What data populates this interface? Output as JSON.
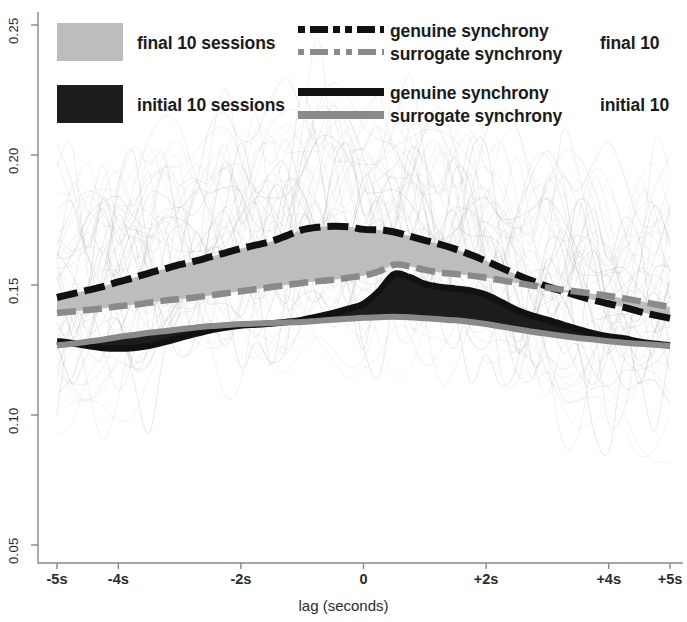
{
  "figure": {
    "background": "#ffffff",
    "axis_color": "#777777"
  },
  "legend": {
    "final_swatch_label": "final 10 sessions",
    "initial_swatch_label": "initial 10 sessions",
    "final_swatch_color": "#bdbdbd",
    "initial_swatch_color": "#1c1c1c",
    "final_genuine_label": "genuine synchrony",
    "final_surrogate_label": "surrogate synchrony",
    "initial_genuine_label": "genuine synchrony",
    "initial_surrogate_label": "surrogate synchrony",
    "final_group_label": "final 10",
    "initial_group_label": "initial 10"
  },
  "chart_data": {
    "type": "area",
    "title": "",
    "xlabel": "lag (seconds)",
    "ylabel": "",
    "xlim": [
      -5,
      5
    ],
    "ylim": [
      0.035,
      0.262
    ],
    "grid": false,
    "legend_position": "top",
    "xticks": [
      -5,
      -4,
      -2,
      0,
      2,
      4,
      5
    ],
    "xticklabels": [
      "-5s",
      "-4s",
      "-2s",
      "0",
      "+2s",
      "+4s",
      "+5s"
    ],
    "yticks": [
      0.05,
      0.1,
      0.15,
      0.2,
      0.25
    ],
    "yticklabels": [
      "0.05",
      "0.10",
      "0.15",
      "0.20",
      "0.25"
    ],
    "x": [
      -5.0,
      -4.75,
      -4.5,
      -4.25,
      -4.0,
      -3.75,
      -3.5,
      -3.25,
      -3.0,
      -2.75,
      -2.5,
      -2.25,
      -2.0,
      -1.75,
      -1.5,
      -1.25,
      -1.0,
      -0.75,
      -0.5,
      -0.25,
      0.0,
      0.25,
      0.5,
      0.75,
      1.0,
      1.25,
      1.5,
      1.75,
      2.0,
      2.25,
      2.5,
      2.75,
      3.0,
      3.25,
      3.5,
      3.75,
      4.0,
      4.25,
      4.5,
      4.75,
      5.0
    ],
    "series": [
      {
        "name": "genuine synchrony - final 10",
        "style": "dashed",
        "color": "#111111",
        "values": [
          0.1452,
          0.1466,
          0.148,
          0.1494,
          0.1512,
          0.1528,
          0.1546,
          0.1562,
          0.1578,
          0.1592,
          0.1608,
          0.1624,
          0.164,
          0.1654,
          0.1668,
          0.169,
          0.1712,
          0.1722,
          0.1726,
          0.1724,
          0.1714,
          0.1712,
          0.1704,
          0.1688,
          0.1672,
          0.1656,
          0.1638,
          0.1616,
          0.1592,
          0.1566,
          0.154,
          0.1516,
          0.1494,
          0.1476,
          0.1458,
          0.1442,
          0.1428,
          0.1414,
          0.1398,
          0.1384,
          0.1372
        ]
      },
      {
        "name": "surrogate synchrony - final 10",
        "style": "dashed",
        "color": "#8a8a8a",
        "values": [
          0.1392,
          0.1398,
          0.1404,
          0.141,
          0.1418,
          0.1424,
          0.1432,
          0.144,
          0.1446,
          0.1452,
          0.146,
          0.1468,
          0.1476,
          0.1484,
          0.1492,
          0.15,
          0.1508,
          0.1514,
          0.152,
          0.1528,
          0.1536,
          0.1552,
          0.1578,
          0.1572,
          0.1558,
          0.1548,
          0.1542,
          0.1536,
          0.1528,
          0.1518,
          0.1508,
          0.1498,
          0.149,
          0.1482,
          0.1474,
          0.1466,
          0.1458,
          0.1448,
          0.1438,
          0.1426,
          0.1415
        ]
      },
      {
        "name": "genuine synchrony - initial 10",
        "style": "solid",
        "color": "#111111",
        "values": [
          0.1284,
          0.1276,
          0.1266,
          0.1258,
          0.1256,
          0.1258,
          0.1266,
          0.128,
          0.1296,
          0.1312,
          0.1326,
          0.1336,
          0.1344,
          0.1348,
          0.1352,
          0.1358,
          0.1366,
          0.1378,
          0.1392,
          0.1408,
          0.1428,
          0.1476,
          0.1542,
          0.153,
          0.1504,
          0.1492,
          0.1486,
          0.1478,
          0.1462,
          0.1434,
          0.1404,
          0.1382,
          0.1366,
          0.1348,
          0.133,
          0.1314,
          0.1302,
          0.1294,
          0.1282,
          0.1274,
          0.1268
        ]
      },
      {
        "name": "surrogate synchrony - initial 10",
        "style": "solid",
        "color": "#8a8a8a",
        "values": [
          0.1268,
          0.1274,
          0.1282,
          0.129,
          0.13,
          0.1308,
          0.1316,
          0.1322,
          0.133,
          0.1336,
          0.1342,
          0.1346,
          0.135,
          0.1352,
          0.1354,
          0.1356,
          0.1358,
          0.1362,
          0.1366,
          0.137,
          0.1374,
          0.1376,
          0.1378,
          0.1376,
          0.1372,
          0.1368,
          0.1364,
          0.1358,
          0.135,
          0.134,
          0.133,
          0.132,
          0.1312,
          0.1304,
          0.1296,
          0.129,
          0.1284,
          0.1278,
          0.1274,
          0.127,
          0.1266
        ]
      }
    ],
    "bands": [
      {
        "name": "final 10 sessions",
        "color": "#bdbdbd",
        "upper_series": "genuine synchrony - final 10",
        "lower_series": "surrogate synchrony - final 10"
      },
      {
        "name": "initial 10 sessions",
        "color": "#1c1c1c",
        "upper_series": "genuine synchrony - initial 10",
        "lower_series": "surrogate synchrony - initial 10"
      }
    ]
  }
}
